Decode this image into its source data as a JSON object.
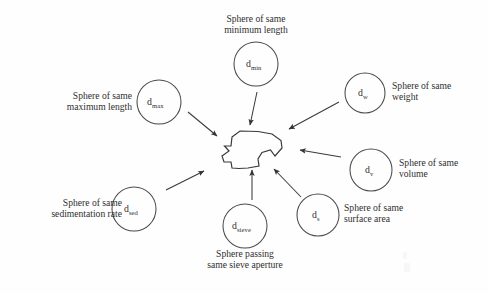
{
  "diagram": {
    "type": "radial-concept-diagram",
    "background_color": "#fefefe",
    "stroke_color": "#3a3a3a",
    "text_color": "#2f2f2f",
    "center": {
      "name": "irregular-particle",
      "description": "irregular particle outline"
    },
    "nodes": [
      {
        "id": "d_min",
        "symbol": "d",
        "subscript": "min",
        "label": "Sphere of same\nminimum length",
        "label_align": "center",
        "circle": {
          "cx": 256,
          "cy": 64,
          "r": 22
        },
        "label_box": {
          "x": 196,
          "y": 13,
          "w": 120,
          "align": "center"
        },
        "arrow": {
          "x1": 257,
          "y1": 92,
          "x2": 250,
          "y2": 127
        }
      },
      {
        "id": "d_w",
        "symbol": "d",
        "subscript": "w",
        "label": "Sphere of same\nweight",
        "label_align": "left",
        "circle": {
          "cx": 365,
          "cy": 93,
          "r": 20
        },
        "label_box": {
          "x": 392,
          "y": 80,
          "w": 96,
          "align": "left"
        },
        "arrow": {
          "x1": 337,
          "y1": 101,
          "x2": 287,
          "y2": 130
        }
      },
      {
        "id": "d_max",
        "symbol": "d",
        "subscript": "max",
        "label": "Sphere of same\nmaximum length",
        "label_align": "right",
        "circle": {
          "cx": 159,
          "cy": 102,
          "r": 22
        },
        "label_box": {
          "x": 32,
          "y": 90,
          "w": 100,
          "align": "right"
        },
        "arrow": {
          "x1": 188,
          "y1": 112,
          "x2": 219,
          "y2": 137
        }
      },
      {
        "id": "d_v",
        "symbol": "d",
        "subscript": "v",
        "label": "Sphere of same\nvolume",
        "label_align": "left",
        "circle": {
          "cx": 371,
          "cy": 170,
          "r": 21
        },
        "label_box": {
          "x": 400,
          "y": 157,
          "w": 90,
          "align": "left"
        },
        "arrow": {
          "x1": 339,
          "y1": 157,
          "x2": 299,
          "y2": 150
        }
      },
      {
        "id": "d_s",
        "symbol": "d",
        "subscript": "s",
        "label": "Sphere of same\nsurface area",
        "label_align": "left",
        "circle": {
          "cx": 318,
          "cy": 215,
          "r": 21
        },
        "label_box": {
          "x": 345,
          "y": 202,
          "w": 92,
          "align": "left"
        },
        "arrow": {
          "x1": 300,
          "y1": 196,
          "x2": 272,
          "y2": 167
        }
      },
      {
        "id": "d_sieve",
        "symbol": "d",
        "subscript": "sieve",
        "label": "Sphere passing\nsame sieve aperture",
        "label_align": "center",
        "circle": {
          "cx": 245,
          "cy": 226,
          "r": 22
        },
        "label_box": {
          "x": 183,
          "y": 247,
          "w": 125,
          "align": "center"
        },
        "arrow": {
          "x1": 252,
          "y1": 198,
          "x2": 252,
          "y2": 168
        }
      },
      {
        "id": "d_sed",
        "symbol": "d",
        "subscript": "sed",
        "label": "Sphere of same\nsedimentation rate",
        "label_align": "right",
        "circle": {
          "cx": 134,
          "cy": 209,
          "r": 22
        },
        "label_box": {
          "x": 12,
          "y": 197,
          "w": 110,
          "align": "right"
        },
        "arrow": {
          "x1": 168,
          "y1": 189,
          "x2": 205,
          "y2": 170
        }
      }
    ]
  }
}
